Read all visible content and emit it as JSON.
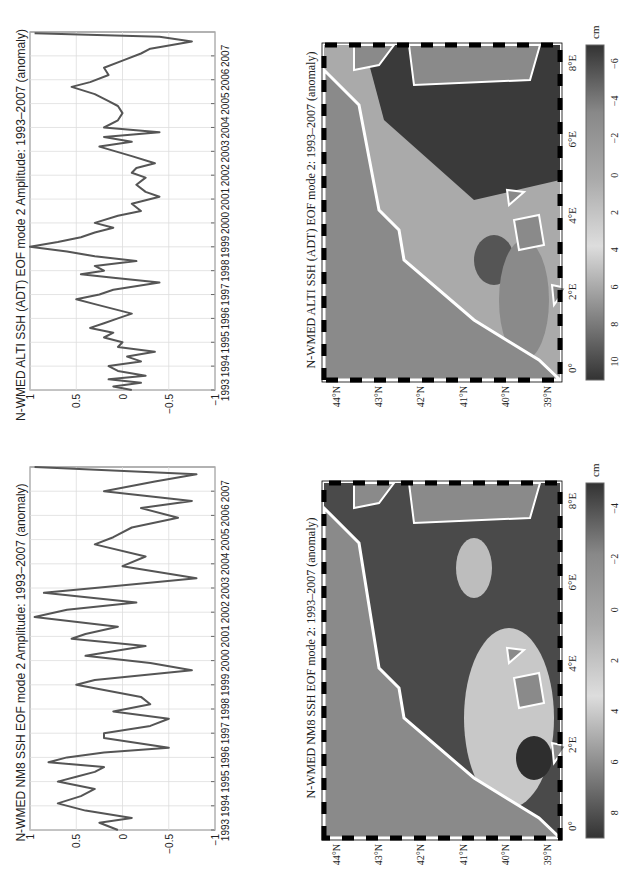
{
  "chart_data": [
    {
      "type": "line",
      "title": "N-WMED ALTI SSH (ADT) EOF mode 2 Amplitude: 1993–2007 (anomaly)",
      "xlabel": "",
      "ylabel": "",
      "xlim": [
        1993,
        2008
      ],
      "ylim": [
        -1,
        1
      ],
      "grid": true,
      "xticks": [
        "1993",
        "1994",
        "1995",
        "1996",
        "1997",
        "1998",
        "1999",
        "2000",
        "2001",
        "2002",
        "2003",
        "2004",
        "2005",
        "2006",
        "2007"
      ],
      "yticks": [
        "1",
        "0.5",
        "0",
        "−0.5",
        "−1"
      ],
      "x": [
        1993.0,
        1993.15,
        1993.3,
        1993.45,
        1993.6,
        1993.8,
        1994.0,
        1994.2,
        1994.4,
        1994.6,
        1994.8,
        1995.0,
        1995.2,
        1995.4,
        1995.6,
        1995.8,
        1996.0,
        1996.2,
        1996.4,
        1996.6,
        1996.8,
        1997.0,
        1997.2,
        1997.5,
        1997.7,
        1997.85,
        1998.0,
        1998.2,
        1998.4,
        1998.6,
        1998.8,
        1999.0,
        1999.2,
        1999.4,
        1999.6,
        1999.8,
        2000.0,
        2000.3,
        2000.5,
        2000.8,
        2001.1,
        2001.3,
        2001.6,
        2001.9,
        2002.1,
        2002.3,
        2002.5,
        2002.8,
        2003.2,
        2003.4,
        2003.6,
        2003.8,
        2004.0,
        2004.3,
        2004.6,
        2004.9,
        2005.1,
        2005.4,
        2005.7,
        2005.9,
        2006.2,
        2006.5,
        2006.8,
        2007.1,
        2007.3,
        2007.6,
        2007.8,
        2007.95
      ],
      "values": [
        -0.1,
        0.1,
        -0.2,
        0.15,
        -0.25,
        0.05,
        0.15,
        -0.2,
        -0.05,
        -0.35,
        0.05,
        0.0,
        0.2,
        0.1,
        0.35,
        0.2,
        0.05,
        -0.1,
        0.1,
        0.3,
        0.5,
        0.25,
        0.1,
        -0.4,
        0.1,
        0.45,
        0.2,
        0.3,
        -0.15,
        0.3,
        0.6,
        1.0,
        0.7,
        0.45,
        0.3,
        0.1,
        0.3,
        0.05,
        -0.2,
        -0.1,
        -0.4,
        -0.25,
        -0.15,
        -0.25,
        -0.1,
        -0.15,
        -0.35,
        -0.1,
        0.25,
        -0.1,
        0.2,
        -0.4,
        0.2,
        0.05,
        0.0,
        0.05,
        0.15,
        0.3,
        0.55,
        0.35,
        0.15,
        0.2,
        0.0,
        -0.2,
        -0.3,
        -0.75,
        -0.4,
        0.95
      ]
    },
    {
      "type": "line",
      "title": "N-WMED NM8 SSH EOF mode 2 Amplitude: 1993–2007 (anomaly)",
      "xlabel": "",
      "ylabel": "",
      "xlim": [
        1993,
        2008
      ],
      "ylim": [
        -1,
        1
      ],
      "grid": true,
      "xticks": [
        "1993",
        "1994",
        "1995",
        "1996",
        "1997",
        "1998",
        "1999",
        "2000",
        "2001",
        "2002",
        "2003",
        "2004",
        "2005",
        "2006",
        "2007"
      ],
      "yticks": [
        "1",
        "0.5",
        "0",
        "−0.5",
        "−1"
      ],
      "x": [
        1993.0,
        1993.3,
        1993.5,
        1993.8,
        1994.1,
        1994.4,
        1994.7,
        1995.0,
        1995.2,
        1995.4,
        1995.6,
        1995.8,
        1996.0,
        1996.2,
        1996.4,
        1996.8,
        1997.0,
        1997.3,
        1997.6,
        1997.9,
        1998.2,
        1998.5,
        1999.0,
        1999.2,
        1999.6,
        1999.9,
        2000.2,
        2000.6,
        2000.9,
        2001.1,
        2001.4,
        2001.8,
        2002.1,
        2002.4,
        2002.8,
        2003.0,
        2003.4,
        2003.9,
        2004.3,
        2004.8,
        2005.1,
        2005.5,
        2005.9,
        2006.3,
        2006.6,
        2007.0,
        2007.4,
        2007.7,
        2008.0
      ],
      "values": [
        0.05,
        0.25,
        -0.1,
        0.4,
        0.7,
        0.45,
        0.3,
        0.7,
        0.5,
        0.3,
        0.2,
        0.8,
        0.6,
        0.2,
        -0.5,
        0.2,
        0.2,
        -0.3,
        -0.5,
        0.1,
        -0.3,
        -0.2,
        0.5,
        0.3,
        -0.75,
        -0.3,
        0.4,
        -0.25,
        0.55,
        0.4,
        0.05,
        0.95,
        0.6,
        -0.15,
        0.85,
        0.3,
        -0.8,
        0.0,
        -0.25,
        0.3,
        0.1,
        -0.1,
        -0.6,
        -0.2,
        -0.75,
        0.2,
        -0.35,
        -0.8,
        0.95
      ]
    },
    {
      "type": "heatmap",
      "title": "N-WMED ALTI SSH (ADT) EOF mode 2: 1993–2007 (anomaly)",
      "lon_ticks": [
        "0°",
        "2°E",
        "4°E",
        "6°E",
        "8°E"
      ],
      "lat_ticks": [
        "44°N",
        "43°N",
        "42°N",
        "41°N",
        "40°N",
        "39°N"
      ],
      "colorbar": {
        "ticks": [
          "10",
          "8",
          "6",
          "4",
          "2",
          "0",
          "−2",
          "−4",
          "−6"
        ],
        "unit": "cm",
        "range": [
          -7,
          10
        ]
      }
    },
    {
      "type": "heatmap",
      "title": "N-WMED NM8 SSH EOF mode 2: 1993–2007 (anomaly)",
      "lon_ticks": [
        "0°",
        "2°E",
        "4°E",
        "6°E",
        "8°E"
      ],
      "lat_ticks": [
        "44°N",
        "43°N",
        "42°N",
        "41°N",
        "40°N",
        "39°N"
      ],
      "colorbar": {
        "ticks": [
          "8",
          "6",
          "4",
          "2",
          "0",
          "−2",
          "−4"
        ],
        "unit": "cm",
        "range": [
          -5,
          9
        ]
      }
    }
  ],
  "panels": {
    "alti_line": {
      "title": "N-WMED ALTI SSH (ADT) EOF mode 2 Amplitude: 1993–2007 (anomaly)"
    },
    "nm8_line": {
      "title": "N-WMED NM8 SSH EOF mode 2 Amplitude: 1993–2007 (anomaly)"
    },
    "alti_map": {
      "title": "N-WMED ALTI SSH (ADT) EOF mode 2: 1993–2007 (anomaly)",
      "unit": "cm"
    },
    "nm8_map": {
      "title": "N-WMED NM8 SSH EOF mode 2: 1993–2007 (anomaly)",
      "unit": "cm"
    }
  },
  "colors": {
    "line": "#555555",
    "land": "#8a8a8a",
    "grid": "#dddddd",
    "frame": "#666666"
  }
}
